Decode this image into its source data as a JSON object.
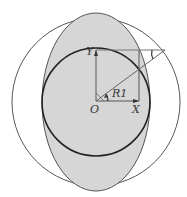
{
  "diagram": {
    "labels": {
      "origin": "O",
      "x_axis": "X",
      "y_axis": "Y",
      "angle": "R1"
    },
    "colors": {
      "ellipse_fill": "#d6d6d6",
      "stroke": "#444444",
      "inner_circle_stroke": "#222222",
      "background": "#ffffff"
    },
    "shapes": {
      "outer_circle": "outer reference circle",
      "ellipse": "shaded ellipse",
      "inner_circle": "inner circle"
    }
  }
}
